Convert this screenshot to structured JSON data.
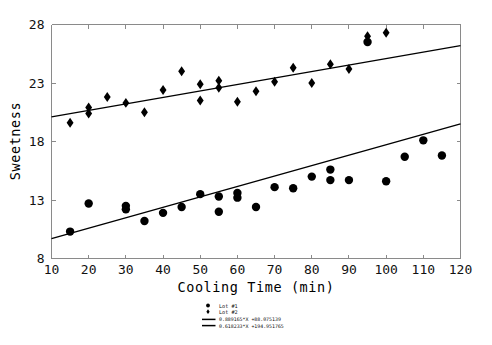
{
  "chart_data": {
    "type": "scatter",
    "title": "",
    "xlabel": "Cooling Time (min)",
    "ylabel": "Sweetness",
    "xlim": [
      10,
      120
    ],
    "ylim": [
      8,
      28
    ],
    "xticks": [
      10,
      20,
      30,
      40,
      50,
      60,
      70,
      80,
      90,
      100,
      110,
      120
    ],
    "xticklabels": [
      "10",
      "20",
      "30",
      "40",
      "50",
      "60",
      "70",
      "80",
      "90",
      "100",
      "110",
      "120"
    ],
    "yticks": [
      8,
      13,
      18,
      23,
      28
    ],
    "yticklabels": [
      "8",
      "13",
      "18",
      "23",
      "28"
    ],
    "grid": false,
    "legend_position": "below-right",
    "series": [
      {
        "name": "Lot #1",
        "marker": "circle",
        "color": "#000000",
        "points": [
          [
            15,
            10.3
          ],
          [
            20,
            12.7
          ],
          [
            30,
            12.2
          ],
          [
            30,
            12.5
          ],
          [
            35,
            11.2
          ],
          [
            40,
            11.9
          ],
          [
            45,
            12.4
          ],
          [
            50,
            13.5
          ],
          [
            55,
            13.3
          ],
          [
            55,
            12.0
          ],
          [
            60,
            13.6
          ],
          [
            60,
            13.2
          ],
          [
            65,
            12.4
          ],
          [
            70,
            14.1
          ],
          [
            75,
            14.0
          ],
          [
            80,
            15.0
          ],
          [
            85,
            15.6
          ],
          [
            85,
            14.7
          ],
          [
            90,
            14.7
          ],
          [
            95,
            26.5
          ],
          [
            100,
            14.6
          ],
          [
            105,
            16.7
          ],
          [
            110,
            18.1
          ],
          [
            115,
            16.8
          ]
        ]
      },
      {
        "name": "Lot #2",
        "marker": "diamond",
        "color": "#000000",
        "points": [
          [
            15,
            19.6
          ],
          [
            20,
            20.9
          ],
          [
            20,
            20.4
          ],
          [
            25,
            21.8
          ],
          [
            30,
            21.3
          ],
          [
            35,
            20.5
          ],
          [
            40,
            22.4
          ],
          [
            45,
            24.0
          ],
          [
            50,
            21.5
          ],
          [
            50,
            22.9
          ],
          [
            55,
            23.2
          ],
          [
            55,
            22.6
          ],
          [
            60,
            21.4
          ],
          [
            65,
            22.3
          ],
          [
            70,
            23.1
          ],
          [
            75,
            24.3
          ],
          [
            80,
            23.0
          ],
          [
            85,
            24.6
          ],
          [
            90,
            24.2
          ],
          [
            95,
            27.0
          ],
          [
            100,
            27.3
          ]
        ]
      }
    ],
    "fits": [
      {
        "label": "0.889165*X +88.075139",
        "for_series": "Lot #1",
        "x0": 10,
        "y0": 9.7,
        "x1": 120,
        "y1": 19.5
      },
      {
        "label": "0.618233*X +194.951765",
        "for_series": "Lot #2",
        "x0": 10,
        "y0": 20.1,
        "x1": 120,
        "y1": 26.2
      }
    ]
  },
  "legend": {
    "entries": [
      {
        "label": "Lot #1",
        "marker": "circle"
      },
      {
        "label": "Lot #2",
        "marker": "diamond"
      }
    ],
    "fit_labels": [
      "0.889165*X +88.075139",
      "0.618233*X +194.951765"
    ]
  }
}
